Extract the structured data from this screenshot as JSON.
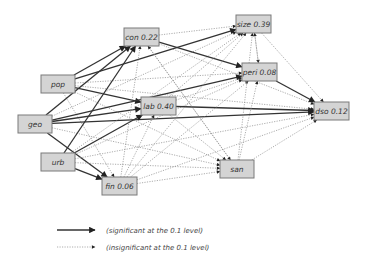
{
  "diagram": {
    "type": "path-diagram",
    "nodes": [
      {
        "id": "con",
        "label": "con 0.22",
        "x": 124,
        "y": 28,
        "w": 35,
        "h": 18
      },
      {
        "id": "pop",
        "label": "pop",
        "x": 41,
        "y": 75,
        "w": 34,
        "h": 18
      },
      {
        "id": "geo",
        "label": "geo",
        "x": 18,
        "y": 115,
        "w": 34,
        "h": 18
      },
      {
        "id": "lab",
        "label": "lab 0.40",
        "x": 141,
        "y": 97,
        "w": 35,
        "h": 18
      },
      {
        "id": "urb",
        "label": "urb",
        "x": 41,
        "y": 153,
        "w": 34,
        "h": 18
      },
      {
        "id": "fin",
        "label": "fin 0.06",
        "x": 102,
        "y": 177,
        "w": 35,
        "h": 18
      },
      {
        "id": "size",
        "label": "size 0.39",
        "x": 236,
        "y": 15,
        "w": 35,
        "h": 18
      },
      {
        "id": "peri",
        "label": "peri 0.08",
        "x": 242,
        "y": 63,
        "w": 35,
        "h": 18
      },
      {
        "id": "dso",
        "label": "dso 0.12",
        "x": 314,
        "y": 102,
        "w": 35,
        "h": 18
      },
      {
        "id": "san",
        "label": "san",
        "x": 220,
        "y": 160,
        "w": 34,
        "h": 18
      }
    ],
    "edges": [
      {
        "from": "pop",
        "to": "con",
        "sig": true
      },
      {
        "from": "pop",
        "to": "size",
        "sig": true
      },
      {
        "from": "pop",
        "to": "lab",
        "sig": true
      },
      {
        "from": "pop",
        "to": "peri",
        "sig": false
      },
      {
        "from": "pop",
        "to": "dso",
        "sig": false
      },
      {
        "from": "pop",
        "to": "san",
        "sig": false
      },
      {
        "from": "pop",
        "to": "fin",
        "sig": false
      },
      {
        "from": "geo",
        "to": "con",
        "sig": true
      },
      {
        "from": "geo",
        "to": "lab",
        "sig": true
      },
      {
        "from": "geo",
        "to": "dso",
        "sig": true
      },
      {
        "from": "geo",
        "to": "peri",
        "sig": true
      },
      {
        "from": "geo",
        "to": "fin",
        "sig": true
      },
      {
        "from": "geo",
        "to": "size",
        "sig": false
      },
      {
        "from": "geo",
        "to": "san",
        "sig": false
      },
      {
        "from": "urb",
        "to": "con",
        "sig": true
      },
      {
        "from": "urb",
        "to": "lab",
        "sig": true
      },
      {
        "from": "urb",
        "to": "fin",
        "sig": true
      },
      {
        "from": "urb",
        "to": "size",
        "sig": false
      },
      {
        "from": "urb",
        "to": "peri",
        "sig": false
      },
      {
        "from": "urb",
        "to": "dso",
        "sig": false
      },
      {
        "from": "urb",
        "to": "san",
        "sig": false
      },
      {
        "from": "con",
        "to": "size",
        "sig": false
      },
      {
        "from": "con",
        "to": "peri",
        "sig": true
      },
      {
        "from": "con",
        "to": "dso",
        "sig": false
      },
      {
        "from": "con",
        "to": "san",
        "sig": false
      },
      {
        "from": "lab",
        "to": "dso",
        "sig": true
      },
      {
        "from": "lab",
        "to": "size",
        "sig": false
      },
      {
        "from": "lab",
        "to": "peri",
        "sig": false
      },
      {
        "from": "lab",
        "to": "san",
        "sig": false
      },
      {
        "from": "fin",
        "to": "size",
        "sig": false
      },
      {
        "from": "fin",
        "to": "peri",
        "sig": false
      },
      {
        "from": "fin",
        "to": "dso",
        "sig": false
      },
      {
        "from": "fin",
        "to": "san",
        "sig": false
      },
      {
        "from": "fin",
        "to": "con",
        "sig": false
      },
      {
        "from": "fin",
        "to": "lab",
        "sig": false
      },
      {
        "from": "size",
        "to": "dso",
        "sig": false
      },
      {
        "from": "size",
        "to": "peri",
        "sig": false
      },
      {
        "from": "peri",
        "to": "dso",
        "sig": true
      },
      {
        "from": "peri",
        "to": "size",
        "sig": false
      },
      {
        "from": "san",
        "to": "dso",
        "sig": false
      },
      {
        "from": "san",
        "to": "peri",
        "sig": false
      },
      {
        "from": "san",
        "to": "size",
        "sig": false
      },
      {
        "from": "san",
        "to": "con",
        "sig": false
      }
    ]
  },
  "legend": {
    "significant": "(significant at the 0.1 level)",
    "insignificant": "(insignificant at the 0.1 level)"
  }
}
